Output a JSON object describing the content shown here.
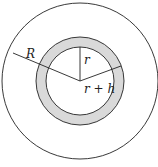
{
  "diagram": {
    "labels": {
      "outer_radius": "R",
      "inner_radius": "r",
      "shell_outer_radius": "r + h"
    },
    "colors": {
      "stroke": "#222222",
      "shell_fill": "#d9d9d9",
      "background": "#ffffff"
    }
  }
}
